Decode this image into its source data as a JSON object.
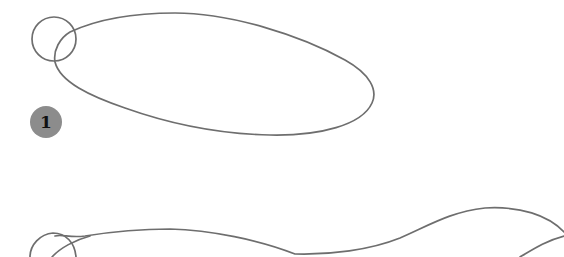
{
  "illustration": {
    "type": "pencil-sketch-drawing-step",
    "stroke_color": "#6e6e6e",
    "background": "#ffffff",
    "step_badge": {
      "label": "1",
      "color": "#8c8c8c",
      "text_color": "#111111"
    },
    "shapes": [
      {
        "name": "head-circle-top",
        "kind": "circle"
      },
      {
        "name": "body-ellipse-top",
        "kind": "ellipse"
      },
      {
        "name": "head-circle-bottom",
        "kind": "circle"
      },
      {
        "name": "body-contour-bottom",
        "kind": "curve"
      },
      {
        "name": "tail-curve-bottom",
        "kind": "curve"
      }
    ]
  }
}
